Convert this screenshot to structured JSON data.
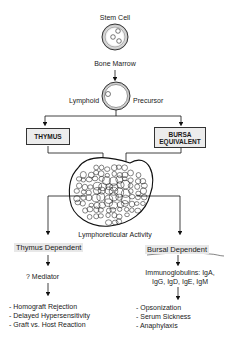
{
  "nodes": {
    "stem_cell": "Stem Cell",
    "bone_marrow": "Bone Marrow",
    "lymphoid": "Lymphoid",
    "precursor": "Precursor",
    "thymus": "THYMUS",
    "bursa_line1": "BURSA",
    "bursa_line2": "EQUIVALENT",
    "lymphoreticular": "Lymphoreticular Activity",
    "thymus_dependent": "Thymus Dependent",
    "bursal_dependent": "Bursal Dependent",
    "mediator": "? Mediator",
    "immuno_line1": "Immunoglobulins: IgA,",
    "immuno_line2": "IgG, IgD, IgE, IgM"
  },
  "thymus_effects": [
    "- Homograft Rejection",
    "- Delayed Hypersensitivity",
    "- Graft vs. Host Reaction"
  ],
  "bursal_effects": [
    "- Opsonization",
    "- Serum Sickness",
    "- Anaphylaxis"
  ]
}
